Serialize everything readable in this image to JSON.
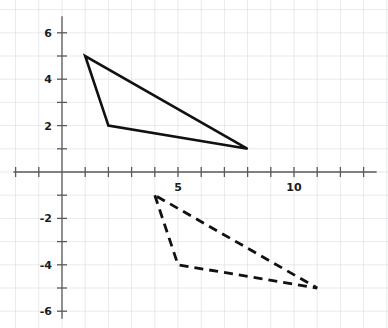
{
  "chart_data": {
    "type": "line",
    "title": "",
    "subtitle": "",
    "xlabel": "",
    "ylabel": "",
    "grid": true,
    "legend": "none",
    "xlim": [
      -2.1,
      13.6
    ],
    "ylim": [
      -6.7,
      6.8
    ],
    "x_ticks": [
      -2,
      -1,
      1,
      2,
      3,
      4,
      5,
      6,
      7,
      8,
      9,
      10,
      11,
      12,
      13
    ],
    "y_ticks": [
      -6,
      -5,
      -4,
      -3,
      -2,
      -1,
      1,
      2,
      3,
      4,
      5,
      6
    ],
    "x_tick_labels": [
      {
        "value": 5,
        "label": "5"
      },
      {
        "value": 10,
        "label": "10"
      }
    ],
    "y_tick_labels": [
      {
        "value": 6,
        "label": "6"
      },
      {
        "value": 4,
        "label": "4"
      },
      {
        "value": 2,
        "label": "2"
      },
      {
        "value": -2,
        "label": "-2"
      },
      {
        "value": -4,
        "label": "-4"
      },
      {
        "value": -6,
        "label": "-6"
      }
    ],
    "series": [
      {
        "name": "solid-triangle",
        "style": "solid",
        "color": "#111111",
        "closed": true,
        "points": [
          {
            "x": 1,
            "y": 5
          },
          {
            "x": 2,
            "y": 2
          },
          {
            "x": 8,
            "y": 1
          }
        ]
      },
      {
        "name": "dashed-triangle",
        "style": "dashed",
        "color": "#111111",
        "closed": true,
        "points": [
          {
            "x": 4,
            "y": -1
          },
          {
            "x": 5,
            "y": -4
          },
          {
            "x": 11,
            "y": -5
          }
        ]
      }
    ]
  },
  "axes": {
    "origin_px": {
      "x": 62,
      "y": 172
    },
    "unit_px": 23.2,
    "x_axis_extent_px": {
      "start": 14,
      "end": 376
    },
    "y_axis_extent_px": {
      "start": 17,
      "end": 318
    },
    "axis_color": "#5a5a5a",
    "grid_color": "#d9dde3"
  }
}
